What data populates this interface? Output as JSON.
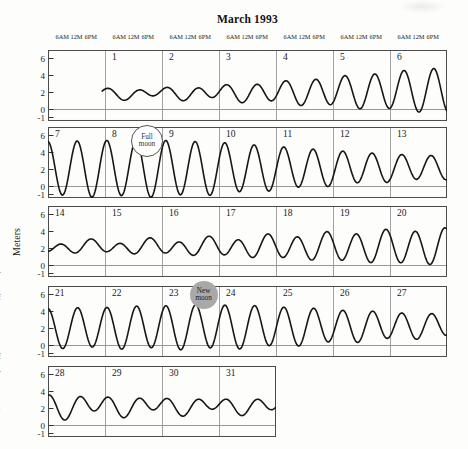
{
  "title": "March 1993",
  "chart_data": {
    "type": "line",
    "title": "March 1993",
    "subtitle": "Daily tide curves arranged as a calendar, two high tides per day",
    "ylabel": "Meters",
    "ylim": [
      -1.45,
      6.9
    ],
    "yticks": [
      6,
      4,
      2,
      0,
      -1
    ],
    "x_time_labels": [
      "6AM",
      "12M",
      "6PM"
    ],
    "grid": true,
    "curve_color": "#161616",
    "grid_color": "#979797",
    "border_color": "#4a4a4a",
    "text_color": "#1c1c1c",
    "tide_frequencies": {
      "semidiurnal_cycles_per_day": 1.932,
      "diurnal_cycles_per_day": 0.966
    },
    "rows": [
      {
        "dates": [
          "",
          "1",
          "2",
          "3",
          "4",
          "5",
          "6"
        ],
        "t_start": 0.95,
        "t_end": 7,
        "t_origin": 0,
        "mean_points": [
          [
            1,
            1.75
          ],
          [
            4,
            1.9
          ],
          [
            7,
            2.2
          ]
        ],
        "semidiurnal_amp_points": [
          [
            1,
            0.5
          ],
          [
            2,
            0.55
          ],
          [
            3,
            0.8
          ],
          [
            4,
            1.2
          ],
          [
            5,
            1.7
          ],
          [
            6,
            2.2
          ],
          [
            7,
            2.7
          ]
        ],
        "diurnal_amp_points": [
          [
            1,
            0.3
          ],
          [
            3,
            0.25
          ],
          [
            5,
            0.15
          ],
          [
            7,
            0.1
          ]
        ],
        "semidiurnal_phase": 0.93,
        "diurnal_phase": 0.148
      },
      {
        "dates": [
          "7",
          "8",
          "9",
          "10",
          "11",
          "12",
          "13"
        ],
        "t_start": 7,
        "t_end": 14,
        "t_origin": 7,
        "mean_points": [
          [
            7,
            2.0
          ],
          [
            13,
            2.1
          ],
          [
            14,
            2.15
          ]
        ],
        "semidiurnal_amp_points": [
          [
            7,
            3.2
          ],
          [
            8,
            3.3
          ],
          [
            9,
            3.3
          ],
          [
            10,
            3.05
          ],
          [
            11,
            2.55
          ],
          [
            12,
            2.05
          ],
          [
            13,
            1.6
          ],
          [
            14,
            1.35
          ]
        ],
        "diurnal_amp_points": [
          [
            7,
            0.1
          ],
          [
            14,
            0.1
          ]
        ],
        "semidiurnal_phase": 0.486,
        "diurnal_phase": 0
      },
      {
        "dates": [
          "14",
          "15",
          "16",
          "17",
          "18",
          "19",
          "20"
        ],
        "t_start": 14,
        "t_end": 21,
        "t_origin": 14,
        "mean_points": [
          [
            14,
            2.1
          ],
          [
            21,
            2.1
          ]
        ],
        "semidiurnal_amp_points": [
          [
            14,
            0.6
          ],
          [
            15,
            0.65
          ],
          [
            16,
            0.8
          ],
          [
            17,
            1.0
          ],
          [
            18,
            1.3
          ],
          [
            19,
            1.6
          ],
          [
            20,
            1.9
          ],
          [
            21,
            2.1
          ]
        ],
        "diurnal_amp_points": [
          [
            14,
            0.3
          ],
          [
            17,
            0.3
          ],
          [
            21,
            0.15
          ]
        ],
        "semidiurnal_phase": 0.502,
        "diurnal_phase": 0.703
      },
      {
        "dates": [
          "21",
          "22",
          "23",
          "24",
          "25",
          "26",
          "27"
        ],
        "t_start": 21,
        "t_end": 28,
        "t_origin": 21,
        "mean_points": [
          [
            21,
            1.95
          ],
          [
            24,
            2.1
          ],
          [
            28,
            2.25
          ]
        ],
        "semidiurnal_amp_points": [
          [
            21,
            2.3
          ],
          [
            22,
            2.4
          ],
          [
            23,
            2.55
          ],
          [
            24,
            2.6
          ],
          [
            25,
            2.35
          ],
          [
            26,
            1.95
          ],
          [
            27,
            1.6
          ],
          [
            28,
            1.3
          ]
        ],
        "diurnal_amp_points": [
          [
            21,
            0.1
          ],
          [
            28,
            0.15
          ]
        ],
        "semidiurnal_phase": 0.428,
        "diurnal_phase": 0
      },
      {
        "dates": [
          "28",
          "29",
          "30",
          "31"
        ],
        "t_start": 28,
        "t_end": 32,
        "t_origin": 28,
        "mean_points": [
          [
            28,
            2.2
          ],
          [
            32,
            2.2
          ]
        ],
        "semidiurnal_amp_points": [
          [
            28,
            1.25
          ],
          [
            29,
            1.0
          ],
          [
            30,
            0.85
          ],
          [
            31,
            0.75
          ],
          [
            32,
            0.8
          ]
        ],
        "diurnal_amp_points": [
          [
            28,
            0.5
          ],
          [
            30,
            0.4
          ],
          [
            32,
            0.35
          ]
        ],
        "semidiurnal_phase": 0.834,
        "diurnal_phase": 0.16
      }
    ],
    "annotations": [
      {
        "label": "Full moon",
        "lines": [
          "Full",
          "moon"
        ],
        "date": "8",
        "style": "open-circle",
        "row_index": 1,
        "t": 8.72,
        "fill": "#ffffff",
        "border": "#555555",
        "text_color": "#333333"
      },
      {
        "label": "New moon",
        "lines": [
          "New",
          "moon"
        ],
        "date": "23",
        "style": "filled-circle",
        "row_index": 3,
        "t": 23.73,
        "fill": "#a9a9a9",
        "border": "none",
        "text_color": "#1b1b1b"
      }
    ]
  },
  "margin_fragments": [
    {
      "text": "-",
      "y": 268
    },
    {
      "text": "f",
      "y": 293
    },
    {
      "text": "f",
      "y": 352
    },
    {
      "text": "-",
      "y": 367
    },
    {
      "text": "l",
      "y": 403
    }
  ]
}
